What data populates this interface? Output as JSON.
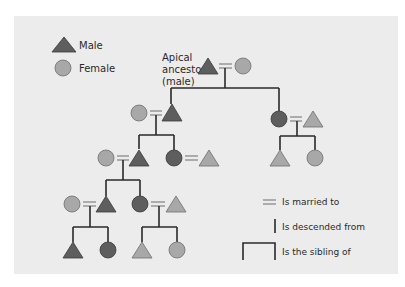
{
  "legend": {
    "male_label": "Male",
    "female_label": "Female"
  },
  "apical": {
    "line1": "Apical",
    "line2": "ancestor",
    "line3": "(male)"
  },
  "key": {
    "married": "Is married to",
    "descended": "Is descended from",
    "sibling": "Is the sibling of"
  },
  "colors": {
    "background": "#ececec",
    "dark_fill": "#5e5e5e",
    "light_fill": "#a8a8a8",
    "line": "#2a2a2a"
  }
}
